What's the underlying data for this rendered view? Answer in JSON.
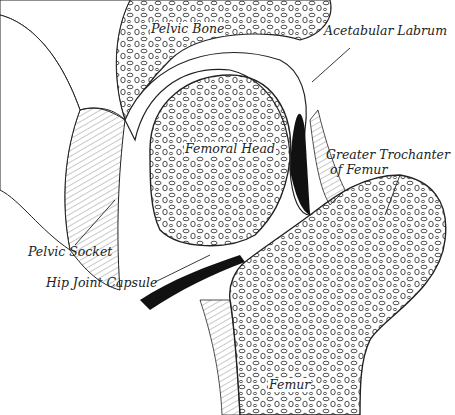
{
  "diagram": {
    "labels": {
      "pelvic_bone": "Pelvic Bone",
      "acetabular_labrum": "Acetabular Labrum",
      "femoral_head": "Femoral Head",
      "greater_trochanter_line1": "Greater Trochanter",
      "greater_trochanter_line2": "of Femur",
      "pelvic_socket": "Pelvic Socket",
      "hip_joint_capsule": "Hip Joint Capsule",
      "femur": "Femur"
    },
    "colors": {
      "ink": "#1a1a1a",
      "paper": "#ffffff",
      "cartilage_dark": "#111111"
    }
  }
}
